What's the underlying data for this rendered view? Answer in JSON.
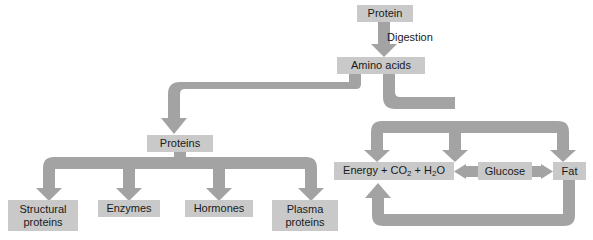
{
  "diagram": {
    "colors": {
      "box_fill": "#c9c9c9",
      "arrow_fill": "#a3a3a3",
      "text": "#1a1a1a",
      "background": "#ffffff"
    },
    "nodes": [
      {
        "id": "protein",
        "label": "Protein",
        "x": 357,
        "y": 5,
        "w": 56,
        "h": 17,
        "lines": [
          "Protein"
        ]
      },
      {
        "id": "amino-acids",
        "label": "Amino acids",
        "x": 337,
        "y": 57,
        "w": 88,
        "h": 17,
        "lines": [
          "Amino acids"
        ]
      },
      {
        "id": "proteins",
        "label": "Proteins",
        "x": 147,
        "y": 135,
        "w": 66,
        "h": 17,
        "lines": [
          "Proteins"
        ]
      },
      {
        "id": "structural-proteins",
        "label": "Structural proteins",
        "x": 8,
        "y": 200,
        "w": 70,
        "h": 31,
        "lines": [
          "Structural",
          "proteins"
        ]
      },
      {
        "id": "enzymes",
        "label": "Enzymes",
        "x": 98,
        "y": 200,
        "w": 62,
        "h": 17,
        "lines": [
          "Enzymes"
        ]
      },
      {
        "id": "hormones",
        "label": "Hormones",
        "x": 185,
        "y": 200,
        "w": 68,
        "h": 17,
        "lines": [
          "Hormones"
        ]
      },
      {
        "id": "plasma-proteins",
        "label": "Plasma proteins",
        "x": 272,
        "y": 200,
        "w": 66,
        "h": 31,
        "lines": [
          "Plasma",
          "proteins"
        ]
      },
      {
        "id": "energy-co2-h2o",
        "label": "Energy + CO2 + H2O",
        "x": 334,
        "y": 162,
        "w": 120,
        "h": 18,
        "lines": [
          "Energy + CO2 + H2O"
        ]
      },
      {
        "id": "glucose",
        "label": "Glucose",
        "x": 478,
        "y": 162,
        "w": 54,
        "h": 18,
        "lines": [
          "Glucose"
        ]
      },
      {
        "id": "fat",
        "label": "Fat",
        "x": 553,
        "y": 162,
        "w": 33,
        "h": 18,
        "lines": [
          "Fat"
        ]
      }
    ],
    "edge_labels": [
      {
        "id": "digestion",
        "text": "Digestion",
        "x": 387,
        "y": 31
      }
    ],
    "energy_formula": {
      "energy": "Energy",
      "plus1": "+",
      "co2_base": "CO",
      "co2_sub": "2",
      "plus2": "+",
      "h2o_h": "H",
      "h2o_sub": "2",
      "h2o_o": "O"
    },
    "edges": [
      {
        "id": "protein-to-amino-acids",
        "from": "protein",
        "to": "amino-acids",
        "type": "arrow-down"
      },
      {
        "id": "amino-acids-to-proteins",
        "from": "amino-acids",
        "to": "proteins",
        "type": "elbow-left-down"
      },
      {
        "id": "proteins-to-structural-proteins",
        "from": "proteins",
        "to": "structural-proteins",
        "type": "branch-down"
      },
      {
        "id": "proteins-to-enzymes",
        "from": "proteins",
        "to": "enzymes",
        "type": "branch-down"
      },
      {
        "id": "proteins-to-hormones",
        "from": "proteins",
        "to": "hormones",
        "type": "branch-down"
      },
      {
        "id": "proteins-to-plasma-proteins",
        "from": "proteins",
        "to": "plasma-proteins",
        "type": "branch-down"
      },
      {
        "id": "amino-acids-to-energy",
        "from": "amino-acids",
        "to": "energy-co2-h2o",
        "type": "branch-down"
      },
      {
        "id": "amino-acids-to-glucose",
        "from": "amino-acids",
        "to": "glucose",
        "type": "branch-down"
      },
      {
        "id": "amino-acids-to-fat",
        "from": "amino-acids",
        "to": "fat",
        "type": "branch-down"
      },
      {
        "id": "glucose-to-energy",
        "from": "glucose",
        "to": "energy-co2-h2o",
        "type": "arrow-left"
      },
      {
        "id": "glucose-to-fat",
        "from": "glucose",
        "to": "fat",
        "type": "arrow-right"
      },
      {
        "id": "fat-to-energy",
        "from": "fat",
        "to": "energy-co2-h2o",
        "type": "loop-bottom-up"
      }
    ]
  }
}
